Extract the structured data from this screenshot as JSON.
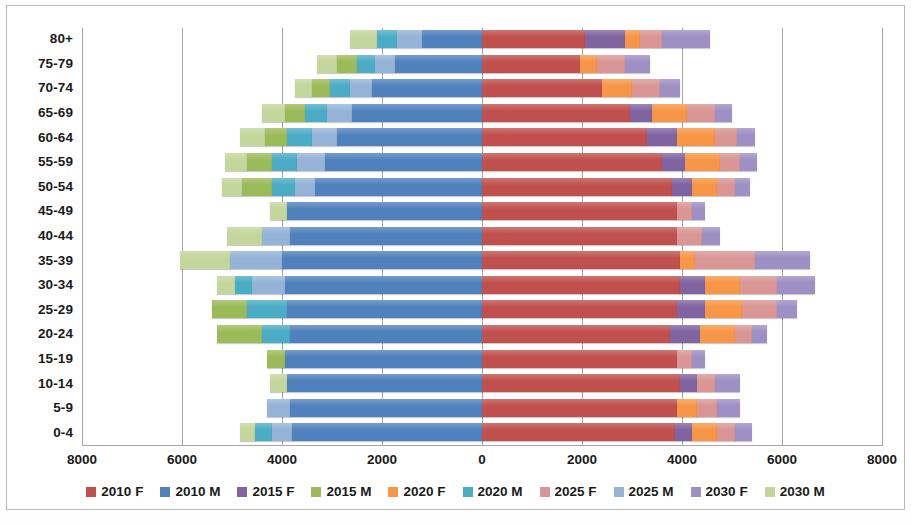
{
  "chart_data": {
    "type": "bar",
    "subtype": "population-pyramid-stacked",
    "title": "",
    "xlabel": "",
    "ylabel": "",
    "grid": true,
    "legend_position": "bottom",
    "axis_max": 8000,
    "x_ticks": [
      "8000",
      "6000",
      "4000",
      "2000",
      "0",
      "2000",
      "4000",
      "6000",
      "8000"
    ],
    "x_tick_values": [
      -8000,
      -6000,
      -4000,
      -2000,
      0,
      2000,
      4000,
      6000,
      8000
    ],
    "categories": [
      "80+",
      "75-79",
      "70-74",
      "65-69",
      "60-64",
      "55-59",
      "50-54",
      "45-49",
      "40-44",
      "35-39",
      "30-34",
      "25-29",
      "20-24",
      "15-19",
      "10-14",
      "5-9",
      "0-4"
    ],
    "series": [
      {
        "name": "2010 F",
        "color": "#C0504D",
        "side": "right",
        "order": 1,
        "values": [
          2050,
          1950,
          2400,
          2950,
          3300,
          3600,
          3800,
          3900,
          3900,
          3950,
          3950,
          3900,
          3750,
          3900,
          3950,
          3900,
          3850
        ]
      },
      {
        "name": "2015 F",
        "color": "#8064A2",
        "side": "right",
        "order": 2,
        "values": [
          800,
          0,
          0,
          450,
          600,
          450,
          400,
          0,
          0,
          0,
          500,
          550,
          600,
          0,
          350,
          0,
          350
        ]
      },
      {
        "name": "2020 F",
        "color": "#F79646",
        "side": "right",
        "order": 3,
        "values": [
          300,
          350,
          600,
          700,
          750,
          700,
          500,
          0,
          0,
          300,
          700,
          750,
          700,
          0,
          0,
          400,
          500
        ]
      },
      {
        "name": "2025 F",
        "color": "#D99694",
        "side": "right",
        "order": 4,
        "values": [
          450,
          550,
          550,
          550,
          450,
          400,
          350,
          300,
          500,
          1200,
          750,
          700,
          350,
          300,
          350,
          400,
          350
        ]
      },
      {
        "name": "2030 F",
        "color": "#9E8FC4",
        "side": "right",
        "order": 5,
        "values": [
          950,
          500,
          400,
          350,
          350,
          350,
          300,
          250,
          350,
          1100,
          750,
          400,
          300,
          250,
          500,
          450,
          350
        ]
      },
      {
        "name": "2010 M",
        "color": "#4F81BD",
        "side": "left",
        "order": 1,
        "values": [
          1200,
          1750,
          2200,
          2600,
          2900,
          3150,
          3350,
          3900,
          3850,
          4000,
          3950,
          3900,
          3850,
          3950,
          3900,
          3850,
          3800
        ]
      },
      {
        "name": "2025 M",
        "color": "#95B3D7",
        "side": "left",
        "order": 2,
        "values": [
          500,
          400,
          450,
          500,
          500,
          550,
          400,
          0,
          550,
          1050,
          650,
          0,
          0,
          0,
          0,
          450,
          400
        ]
      },
      {
        "name": "2020 M",
        "color": "#4BACC6",
        "side": "left",
        "order": 3,
        "values": [
          400,
          350,
          400,
          450,
          500,
          500,
          450,
          0,
          0,
          0,
          350,
          800,
          550,
          0,
          0,
          0,
          350
        ]
      },
      {
        "name": "2015 M",
        "color": "#9BBB59",
        "side": "left",
        "order": 4,
        "values": [
          0,
          400,
          350,
          400,
          450,
          500,
          600,
          0,
          0,
          0,
          0,
          700,
          900,
          350,
          0,
          0,
          0
        ]
      },
      {
        "name": "2030 M",
        "color": "#C3D69B",
        "side": "left",
        "order": 5,
        "values": [
          550,
          400,
          350,
          450,
          500,
          450,
          400,
          350,
          700,
          1000,
          350,
          0,
          0,
          0,
          350,
          0,
          300
        ]
      }
    ]
  },
  "legend": {
    "items": [
      {
        "label": "2010 F",
        "color": "#C0504D"
      },
      {
        "label": "2010 M",
        "color": "#4F81BD"
      },
      {
        "label": "2015 F",
        "color": "#8064A2"
      },
      {
        "label": "2015 M",
        "color": "#9BBB59"
      },
      {
        "label": "2020 F",
        "color": "#F79646"
      },
      {
        "label": "2020 M",
        "color": "#4BACC6"
      },
      {
        "label": "2025 F",
        "color": "#D99694"
      },
      {
        "label": "2025 M",
        "color": "#95B3D7"
      },
      {
        "label": "2030 F",
        "color": "#9E8FC4"
      },
      {
        "label": "2030 M",
        "color": "#C3D69B"
      }
    ]
  }
}
